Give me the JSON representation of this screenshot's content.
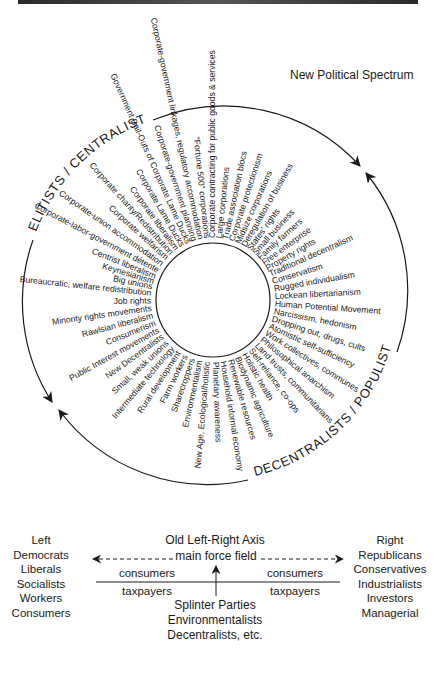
{
  "title": "New Political Spectrum",
  "circle_labels": {
    "top_left": "ELITISTS / CENTRALISTS",
    "bottom_right": "DECENTRALISTS / POPULISTS"
  },
  "spokes": [
    {
      "text": "Corporate-labor-government détente",
      "angle": 208
    },
    {
      "text": "Corporate-union accommodation",
      "angle": 215
    },
    {
      "text": "Corporate welfarism",
      "angle": 222
    },
    {
      "text": "Corporate charity/Redistribution",
      "angle": 228
    },
    {
      "text": "Corporate liberalism",
      "angle": 234
    },
    {
      "text": "Corporate Lame Ducks",
      "angle": 240
    },
    {
      "text": "Government Bail-Outs of Corporate Lame Ducks",
      "angle": 246
    },
    {
      "text": "Corporate-government planning",
      "angle": 252
    },
    {
      "text": "Corporate-government linkages, regulatory accommodation",
      "angle": 258
    },
    {
      "text": "\"Fortune 500\" corporations",
      "angle": 264
    },
    {
      "text": "Corporate contracting for public goods & services",
      "angle": 270
    },
    {
      "text": "Large corporations",
      "angle": 276
    },
    {
      "text": "Trade association blocs",
      "angle": 282
    },
    {
      "text": "Corporate protectionism",
      "angle": 288
    },
    {
      "text": "Midsize corporations",
      "angle": 294
    },
    {
      "text": "Deregulation of business",
      "angle": 300
    },
    {
      "text": "States' rights",
      "angle": 306
    },
    {
      "text": "Small business",
      "angle": 312
    },
    {
      "text": "Family farmers",
      "angle": 318
    },
    {
      "text": "Free enterprise",
      "angle": 324
    },
    {
      "text": "Property rights",
      "angle": 330
    },
    {
      "text": "Traditional decentralism",
      "angle": 336
    },
    {
      "text": "Conservatism",
      "angle": 343
    },
    {
      "text": "Rugged individualism",
      "angle": 350
    },
    {
      "text": "Lockean libertarianism",
      "angle": 357
    },
    {
      "text": "Human Potential Movement",
      "angle": 4
    },
    {
      "text": "Narcissism, hedonism",
      "angle": 11
    },
    {
      "text": "Dropping out, drugs, cults",
      "angle": 18
    },
    {
      "text": "Atomistic self-sufficiency",
      "angle": 25
    },
    {
      "text": "Work collectives, communes",
      "angle": 32
    },
    {
      "text": "Philosophical anarchism",
      "angle": 39
    },
    {
      "text": "Land trusts, communitarians",
      "angle": 46
    },
    {
      "text": "Self-reliance, co-ops",
      "angle": 53
    },
    {
      "text": "Holistic health",
      "angle": 60
    },
    {
      "text": "Biodynamic agriculture",
      "angle": 67
    },
    {
      "text": "Renewable resources",
      "angle": 74
    },
    {
      "text": "Household informal economy",
      "angle": 81
    },
    {
      "text": "Planetary awareness",
      "angle": 88
    },
    {
      "text": "New Age, Ecological/holistic",
      "angle": 95
    },
    {
      "text": "Environmentalism",
      "angle": 102
    },
    {
      "text": "Sharecroppers",
      "angle": 109
    },
    {
      "text": "Farm workers",
      "angle": 116
    },
    {
      "text": "Rural development",
      "angle": 123
    },
    {
      "text": "Intermediate technology",
      "angle": 130
    },
    {
      "text": "Small, weak unions",
      "angle": 137
    },
    {
      "text": "New Decentralists",
      "angle": 144
    },
    {
      "text": "Public Interest movements",
      "angle": 151
    },
    {
      "text": "Consumerism",
      "angle": 158
    },
    {
      "text": "Rawlsian liberalism",
      "angle": 165
    },
    {
      "text": "Minority rights movements",
      "angle": 172
    },
    {
      "text": "Job rights",
      "angle": 179
    },
    {
      "text": "Bureaucratic, welfare redistribution",
      "angle": 186
    },
    {
      "text": "Big unions",
      "angle": 192
    },
    {
      "text": "Keynesianism",
      "angle": 197
    },
    {
      "text": "Centrist liberalism",
      "angle": 202
    }
  ],
  "axis": {
    "title": "Old Left-Right Axis",
    "main_label": "main force field",
    "left_heading": "Left",
    "left_items": [
      "Democrats",
      "Liberals",
      "Socialists",
      "Workers",
      "Consumers"
    ],
    "right_heading": "Right",
    "right_items": [
      "Republicans",
      "Conservatives",
      "Industrialists",
      "Investors",
      "Managerial"
    ],
    "left_above": "consumers",
    "left_below": "taxpayers",
    "right_above": "consumers",
    "right_below": "taxpayers",
    "splinter": [
      "Splinter Parties",
      "Environmentalists",
      "Decentralists, etc."
    ]
  },
  "colors": {
    "ink": "#1a1a1a",
    "background": "#ffffff"
  }
}
